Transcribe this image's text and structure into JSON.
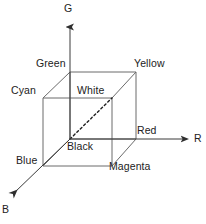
{
  "figure": {
    "background_color": "#ffffff",
    "line_color": "#6b6b6b",
    "axis_color": "#3a3a3a",
    "text_color": "#222222"
  },
  "axes": [
    {
      "name": "green-axis",
      "label": "G",
      "direction": "up",
      "label_x": 64,
      "label_y": 2
    },
    {
      "name": "red-axis",
      "label": "R",
      "direction": "right",
      "label_x": 194,
      "label_y": 132
    },
    {
      "name": "blue-axis",
      "label": "B",
      "direction": "down-left",
      "label_x": 2,
      "label_y": 203
    }
  ],
  "vertices": [
    {
      "name": "green",
      "label": "Green",
      "label_x": 36,
      "label_y": 57,
      "corner_x": 70,
      "corner_y": 72
    },
    {
      "name": "yellow",
      "label": "Yellow",
      "label_x": 134,
      "label_y": 57,
      "corner_x": 136,
      "corner_y": 72
    },
    {
      "name": "cyan",
      "label": "Cyan",
      "label_x": 11,
      "label_y": 84,
      "corner_x": 43,
      "corner_y": 98
    },
    {
      "name": "white",
      "label": "White",
      "label_x": 77,
      "label_y": 84,
      "corner_x": 112,
      "corner_y": 98
    },
    {
      "name": "red",
      "label": "Red",
      "label_x": 137,
      "label_y": 124,
      "corner_x": 136,
      "corner_y": 139
    },
    {
      "name": "black",
      "label": "Black",
      "label_x": 67,
      "label_y": 140,
      "corner_x": 70,
      "corner_y": 139
    },
    {
      "name": "blue",
      "label": "Blue",
      "label_x": 16,
      "label_y": 154,
      "corner_x": 43,
      "corner_y": 166
    },
    {
      "name": "magenta",
      "label": "Magenta",
      "label_x": 109,
      "label_y": 160,
      "corner_x": 112,
      "corner_y": 166
    }
  ],
  "diagonal": {
    "name": "black-to-white-gray-axis",
    "style": "dashed",
    "from": "black",
    "to": "white"
  }
}
